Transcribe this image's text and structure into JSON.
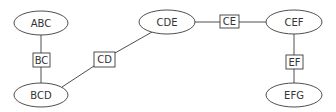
{
  "diagram": {
    "type": "junction-tree",
    "colors": {
      "stroke": "#3a3a3a",
      "text": "#333333",
      "background": "#ffffff"
    },
    "cliques": [
      {
        "id": "ABC",
        "label": "ABC",
        "cx": 41,
        "cy": 23,
        "rx": 27,
        "ry": 12
      },
      {
        "id": "BCD",
        "label": "BCD",
        "cx": 41,
        "cy": 95,
        "rx": 27,
        "ry": 12
      },
      {
        "id": "CDE",
        "label": "CDE",
        "cx": 167,
        "cy": 22,
        "rx": 28,
        "ry": 12
      },
      {
        "id": "CEF",
        "label": "CEF",
        "cx": 294,
        "cy": 22,
        "rx": 28,
        "ry": 12
      },
      {
        "id": "EFG",
        "label": "EFG",
        "cx": 294,
        "cy": 95,
        "rx": 28,
        "ry": 12
      }
    ],
    "separators": [
      {
        "id": "BC",
        "label": "BC",
        "x": 33,
        "y": 53,
        "w": 17,
        "h": 14,
        "between": [
          "ABC",
          "BCD"
        ]
      },
      {
        "id": "CD",
        "label": "CD",
        "x": 94,
        "y": 52,
        "w": 21,
        "h": 15,
        "between": [
          "BCD",
          "CDE"
        ]
      },
      {
        "id": "CE",
        "label": "CE",
        "x": 220,
        "y": 15,
        "w": 19,
        "h": 13,
        "between": [
          "CDE",
          "CEF"
        ]
      },
      {
        "id": "EF",
        "label": "EF",
        "x": 286,
        "y": 55,
        "w": 17,
        "h": 14,
        "between": [
          "CEF",
          "EFG"
        ]
      }
    ]
  }
}
